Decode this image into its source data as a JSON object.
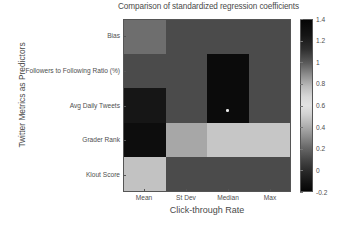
{
  "chart_data": {
    "type": "heatmap",
    "title": "Comparison of standardized regression coefficients",
    "xlabel": "Click-through Rate",
    "ylabel": "Twitter Metrics as Predictors",
    "categories": [
      "Mean",
      "St Dev",
      "Median",
      "Max"
    ],
    "rows": [
      "Bias",
      "Followers to Following Ratio (%)",
      "Avg Daily Tweets",
      "Grader Rank",
      "Klout Score"
    ],
    "colorbar": {
      "ticks": [
        "1.4",
        "1.2",
        "1",
        "0.8",
        "0.6",
        "0.4",
        "0.2",
        "0",
        "-0.2"
      ],
      "tick_values": [
        1.4,
        1.2,
        1,
        0.8,
        0.6,
        0.4,
        0.2,
        0,
        -0.2
      ],
      "vmin": -0.2,
      "vmax": 1.4,
      "orientation": "vertical",
      "position": "right"
    },
    "grid": false,
    "cells": [
      {
        "row": "Bias",
        "col": "Mean",
        "value": 0.35,
        "color": "#6e6e6e"
      },
      {
        "row": "Bias",
        "col": "St Dev",
        "value": 0.2,
        "color": "#4b4b4b"
      },
      {
        "row": "Bias",
        "col": "Median",
        "value": 0.2,
        "color": "#4b4b4b"
      },
      {
        "row": "Bias",
        "col": "Max",
        "value": 0.2,
        "color": "#4b4b4b"
      },
      {
        "row": "Followers to Following Ratio (%)",
        "col": "Mean",
        "value": 0.2,
        "color": "#4b4b4b"
      },
      {
        "row": "Followers to Following Ratio (%)",
        "col": "St Dev",
        "value": 0.2,
        "color": "#4b4b4b"
      },
      {
        "row": "Followers to Following Ratio (%)",
        "col": "Median",
        "value": 1.4,
        "color": "#0b0b0b"
      },
      {
        "row": "Followers to Following Ratio (%)",
        "col": "Max",
        "value": 0.2,
        "color": "#4b4b4b"
      },
      {
        "row": "Avg Daily Tweets",
        "col": "Mean",
        "value": 1.35,
        "color": "#161616"
      },
      {
        "row": "Avg Daily Tweets",
        "col": "St Dev",
        "value": 0.2,
        "color": "#4b4b4b"
      },
      {
        "row": "Avg Daily Tweets",
        "col": "Median",
        "value": 1.4,
        "color": "#0b0b0b"
      },
      {
        "row": "Avg Daily Tweets",
        "col": "Max",
        "value": 0.2,
        "color": "#4b4b4b"
      },
      {
        "row": "Grader Rank",
        "col": "Mean",
        "value": 1.4,
        "color": "#0d0d0d"
      },
      {
        "row": "Grader Rank",
        "col": "St Dev",
        "value": 0.52,
        "color": "#a7a7a7"
      },
      {
        "row": "Grader Rank",
        "col": "Median",
        "value": 0.58,
        "color": "#c6c6c6"
      },
      {
        "row": "Grader Rank",
        "col": "Max",
        "value": 0.58,
        "color": "#c6c6c6"
      },
      {
        "row": "Klout Score",
        "col": "Mean",
        "value": 0.57,
        "color": "#c2c2c2"
      },
      {
        "row": "Klout Score",
        "col": "St Dev",
        "value": 0.2,
        "color": "#4b4b4b"
      },
      {
        "row": "Klout Score",
        "col": "Median",
        "value": 0.2,
        "color": "#4b4b4b"
      },
      {
        "row": "Klout Score",
        "col": "Max",
        "value": 0.2,
        "color": "#4b4b4b"
      }
    ],
    "marker": {
      "row": "Avg Daily Tweets",
      "col": "Median",
      "shape": "dot",
      "color": "#e8e8e8"
    }
  }
}
